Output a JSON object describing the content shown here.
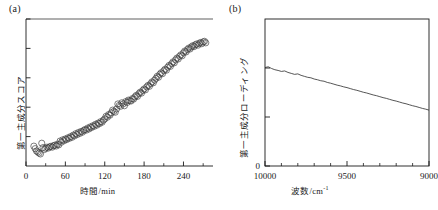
{
  "figure": {
    "background": "#ffffff",
    "ink": "#1a1a1a",
    "panels": [
      {
        "id": "a",
        "label": "(a)"
      },
      {
        "id": "b",
        "label": "(b)"
      }
    ]
  },
  "panel_a": {
    "label": "(a)",
    "x_axis_title": "時間/min",
    "y_axis_title": "第一主成分スコア",
    "x_ticks": [
      "0",
      "60",
      "120",
      "180",
      "240"
    ],
    "y_ticks": [
      "",
      "",
      "",
      "",
      ""
    ]
  },
  "panel_b": {
    "label": "(b)",
    "x_axis_title_main": "波数/cm",
    "x_axis_title_sup": "-1",
    "y_axis_title": "第一主成分ローディング",
    "x_ticks": [
      "10000",
      "9500",
      "9000"
    ],
    "y_ticks": [
      "",
      "",
      "0"
    ],
    "y_zero_label": "0"
  },
  "chart_data": [
    {
      "type": "scatter",
      "panel": "a",
      "title": "(a)",
      "xlabel": "時間/min",
      "ylabel": "第一主成分スコア",
      "xlim": [
        0,
        285
      ],
      "ylim": [
        0,
        10
      ],
      "xticks": [
        0,
        60,
        120,
        180,
        240
      ],
      "xticklabels": [
        "0",
        "60",
        "120",
        "180",
        "240"
      ],
      "yticks": [
        0,
        2,
        4,
        6,
        8,
        10
      ],
      "yticklabels": [
        "",
        "",
        "",
        "",
        "",
        ""
      ],
      "grid": false,
      "legend": null,
      "marker": "open-circle",
      "marker_size": 3.1,
      "x": [
        12,
        14,
        16,
        18,
        20,
        22,
        24,
        26,
        28,
        30,
        32,
        34,
        36,
        38,
        40,
        42,
        44,
        46,
        48,
        50,
        52,
        54,
        56,
        58,
        60,
        62,
        64,
        66,
        68,
        70,
        72,
        74,
        76,
        78,
        80,
        82,
        84,
        86,
        88,
        90,
        92,
        94,
        96,
        98,
        100,
        102,
        104,
        106,
        108,
        110,
        112,
        114,
        116,
        118,
        120,
        122,
        124,
        126,
        128,
        130,
        132,
        134,
        136,
        138,
        140,
        142,
        144,
        146,
        148,
        150,
        152,
        154,
        156,
        158,
        160,
        162,
        164,
        166,
        168,
        170,
        172,
        174,
        176,
        178,
        180,
        182,
        184,
        186,
        188,
        190,
        192,
        194,
        196,
        198,
        200,
        202,
        204,
        206,
        208,
        210,
        212,
        214,
        216,
        218,
        220,
        222,
        224,
        226,
        228,
        230,
        232,
        234,
        236,
        238,
        240,
        242,
        244,
        246,
        248,
        250,
        252,
        254,
        256,
        258,
        260,
        262,
        264,
        266,
        268,
        270,
        272,
        274
      ],
      "y": [
        1.35,
        1.18,
        1.02,
        0.95,
        0.88,
        0.82,
        1.55,
        1.25,
        1.12,
        1.2,
        1.28,
        1.22,
        1.3,
        1.34,
        1.28,
        1.38,
        1.42,
        1.36,
        1.48,
        1.44,
        1.7,
        1.62,
        1.78,
        1.72,
        1.84,
        1.8,
        1.92,
        1.88,
        2.0,
        1.95,
        2.1,
        2.05,
        2.2,
        2.14,
        2.28,
        2.22,
        2.35,
        2.3,
        2.42,
        2.48,
        2.44,
        2.58,
        2.52,
        2.66,
        2.62,
        2.74,
        2.7,
        2.84,
        2.78,
        2.92,
        2.88,
        3.02,
        2.98,
        3.12,
        3.2,
        3.38,
        3.32,
        3.5,
        3.46,
        3.62,
        3.8,
        3.72,
        3.66,
        3.88,
        4.22,
        4.12,
        4.06,
        4.3,
        4.22,
        4.1,
        4.38,
        4.32,
        4.48,
        4.44,
        4.42,
        4.58,
        4.55,
        4.7,
        4.8,
        4.74,
        4.92,
        5.02,
        4.96,
        5.14,
        5.24,
        5.18,
        5.38,
        5.48,
        5.42,
        5.6,
        5.72,
        5.66,
        5.84,
        5.96,
        6.1,
        6.04,
        6.24,
        6.34,
        6.28,
        6.48,
        6.58,
        6.52,
        6.72,
        6.84,
        6.78,
        6.96,
        7.08,
        7.02,
        7.22,
        7.34,
        7.28,
        7.46,
        7.56,
        7.5,
        7.7,
        7.82,
        7.76,
        7.92,
        8.02,
        7.96,
        8.1,
        8.18,
        8.12,
        8.24,
        8.3,
        8.22,
        8.34,
        8.4,
        8.32,
        8.44,
        8.48,
        8.38
      ]
    },
    {
      "type": "line",
      "panel": "b",
      "title": "(b)",
      "xlabel": "波数/cm-1",
      "ylabel": "第一主成分ローディング",
      "xlim": [
        10000,
        9000
      ],
      "ylim": [
        0,
        6
      ],
      "x_inverted": true,
      "xticks": [
        10000,
        9500,
        9000
      ],
      "xticklabels": [
        "10000",
        "9500",
        "9000"
      ],
      "yticks": [
        0,
        2,
        4
      ],
      "yticklabels": [
        "0",
        "",
        ""
      ],
      "grid": false,
      "legend": null,
      "line_width": 0.8,
      "x_values": [
        10000,
        9980,
        9960,
        9940,
        9920,
        9900,
        9880,
        9860,
        9840,
        9820,
        9800,
        9780,
        9760,
        9740,
        9720,
        9700,
        9680,
        9660,
        9640,
        9620,
        9600,
        9580,
        9560,
        9540,
        9520,
        9500,
        9480,
        9460,
        9440,
        9420,
        9400,
        9380,
        9360,
        9340,
        9320,
        9300,
        9280,
        9260,
        9240,
        9220,
        9200,
        9180,
        9160,
        9140,
        9120,
        9100,
        9080,
        9060,
        9040,
        9020,
        9000
      ],
      "y_values": [
        4.02,
        4.05,
        3.98,
        3.93,
        3.9,
        3.86,
        3.88,
        3.82,
        3.78,
        3.74,
        3.76,
        3.7,
        3.66,
        3.62,
        3.6,
        3.55,
        3.52,
        3.48,
        3.46,
        3.41,
        3.38,
        3.34,
        3.3,
        3.27,
        3.23,
        3.2,
        3.16,
        3.12,
        3.09,
        3.05,
        3.01,
        2.98,
        2.94,
        2.9,
        2.87,
        2.83,
        2.79,
        2.76,
        2.72,
        2.68,
        2.65,
        2.61,
        2.57,
        2.54,
        2.5,
        2.46,
        2.43,
        2.39,
        2.35,
        2.32,
        2.28
      ]
    }
  ]
}
